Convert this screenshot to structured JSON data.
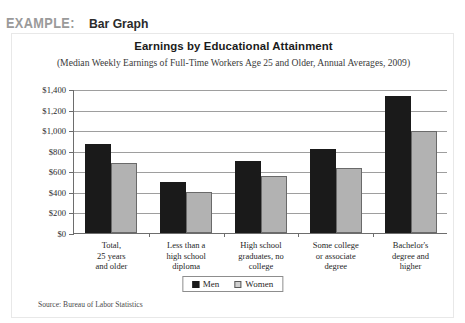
{
  "header": {
    "example_label": "EXAMPLE:",
    "example_kind": "Bar Graph"
  },
  "source_note": "Source: Bureau of Labor Statistics",
  "legend": {
    "items": [
      {
        "label": "Men",
        "color": "#1a1a1a"
      },
      {
        "label": "Women",
        "color": "#b2b2b2"
      }
    ]
  },
  "chart_data": {
    "type": "bar",
    "title": "Earnings by Educational Attainment",
    "subtitle": "(Median Weekly Earnings of Full-Time Workers Age 25 and Older, Annual Averages, 2009)",
    "xlabel": "",
    "ylabel": "",
    "ylim": [
      0,
      1400
    ],
    "grid": true,
    "legend_position": "bottom-center",
    "ticks": [
      "$0",
      "$200",
      "$400",
      "$600",
      "$800",
      "$1,000",
      "$1,200",
      "$1,400"
    ],
    "tick_values": [
      0,
      200,
      400,
      600,
      800,
      1000,
      1200,
      1400
    ],
    "categories": [
      "Total,\n25 years\nand older",
      "Less than a\nhigh school\ndiploma",
      "High school\ngraduates, no\ncollege",
      "Some college\nor associate\ndegree",
      "Bachelor's\ndegree and\nhigher"
    ],
    "series": [
      {
        "name": "Men",
        "color": "#1a1a1a",
        "values": [
          870,
          500,
          700,
          815,
          1330
        ]
      },
      {
        "name": "Women",
        "color": "#b2b2b2",
        "values": [
          680,
          395,
          555,
          635,
          990
        ]
      }
    ]
  }
}
